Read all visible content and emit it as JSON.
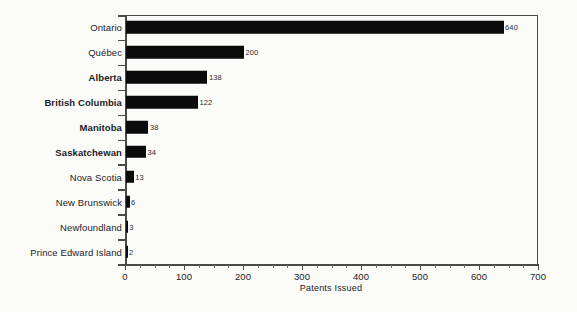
{
  "chart_data": {
    "type": "bar",
    "orientation": "horizontal",
    "title": "",
    "xlabel": "Patents Issued",
    "ylabel": "",
    "xlim": [
      0,
      700
    ],
    "xticks": [
      0,
      100,
      200,
      300,
      400,
      500,
      600,
      700
    ],
    "xtick_labels": [
      "0",
      "100",
      "200",
      "300",
      "400",
      "500",
      "600",
      "700"
    ],
    "minor_tick_step": 25,
    "grid": false,
    "legend": null,
    "bar_color": "#0b0b0b",
    "axis_color": "#4a4a4a",
    "categories": [
      "Ontario",
      "Québec",
      "Alberta",
      "British Columbia",
      "Manitoba",
      "Saskatchewan",
      "Nova Scotia",
      "New Brunswick",
      "Newfoundland",
      "Prince Edward Island"
    ],
    "values": [
      640,
      200,
      138,
      122,
      38,
      34,
      13,
      6,
      3,
      2
    ],
    "value_labels": [
      "640",
      "200",
      "138",
      "122",
      "38",
      "34",
      "13",
      "6",
      "3",
      "2"
    ],
    "emphasized_categories": [
      "Alberta",
      "British Columbia",
      "Manitoba",
      "Saskatchewan"
    ],
    "rows": [
      {
        "label": "Ontario",
        "value": 640,
        "value_label": "640",
        "bold": false
      },
      {
        "label": "Québec",
        "value": 200,
        "value_label": "200",
        "bold": false
      },
      {
        "label": "Alberta",
        "value": 138,
        "value_label": "138",
        "bold": true
      },
      {
        "label": "British Columbia",
        "value": 122,
        "value_label": "122",
        "bold": true
      },
      {
        "label": "Manitoba",
        "value": 38,
        "value_label": "38",
        "bold": true
      },
      {
        "label": "Saskatchewan",
        "value": 34,
        "value_label": "34",
        "bold": true
      },
      {
        "label": "Nova Scotia",
        "value": 13,
        "value_label": "13",
        "bold": false
      },
      {
        "label": "New Brunswick",
        "value": 6,
        "value_label": "6",
        "bold": false
      },
      {
        "label": "Newfoundland",
        "value": 3,
        "value_label": "3",
        "bold": false
      },
      {
        "label": "Prince Edward Island",
        "value": 2,
        "value_label": "2",
        "bold": false
      }
    ]
  }
}
